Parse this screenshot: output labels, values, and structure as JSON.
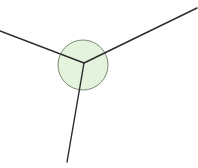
{
  "diagram": {
    "type": "junction",
    "background": "#ffffff",
    "node": {
      "cx": 83,
      "cy": 65,
      "r": 25,
      "fill": "#e3f3dc",
      "stroke": "#7a8a74"
    },
    "junction_point": {
      "x": 84,
      "y": 63
    },
    "edges": [
      {
        "id": "left",
        "x1": 0,
        "y1": 31,
        "x2": 84,
        "y2": 63
      },
      {
        "id": "upper-right",
        "x1": 197,
        "y1": 8,
        "x2": 84,
        "y2": 63
      },
      {
        "id": "bottom",
        "x1": 84,
        "y1": 63,
        "x2": 67,
        "y2": 162
      }
    ],
    "edge_color": "#2b2b2b",
    "edge_width": 1.4
  }
}
